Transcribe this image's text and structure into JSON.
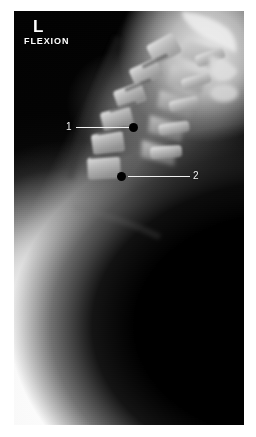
{
  "study": {
    "modality": "radiograph",
    "region": "cervical-spine",
    "projection_label": "FLEXION",
    "side_marker": "L",
    "view": "lateral"
  },
  "image": {
    "width": 256,
    "height": 437,
    "plate": {
      "left": 14,
      "top": 11,
      "width": 230,
      "height": 414
    },
    "background_color": "#ffffff",
    "film_dark_color": "#060606",
    "film_light_color": "#e4e4e4"
  },
  "annotations": {
    "marker_color": "#f2f2f2",
    "dot_color": "#000000",
    "items": [
      {
        "label": "1",
        "label_x": 66,
        "label_y": 122,
        "line_x": 76,
        "line_y": 127,
        "line_width": 54,
        "dot_x": 129,
        "dot_y": 123
      },
      {
        "label": "2",
        "label_x": 193,
        "label_y": 171,
        "line_x": 128,
        "line_y": 176,
        "line_width": 62,
        "dot_x": 117,
        "dot_y": 172
      }
    ]
  },
  "anatomy": {
    "vertebrae": [
      {
        "name": "C2-body",
        "x": 150,
        "y": 38,
        "w": 30,
        "h": 22,
        "rot": -28
      },
      {
        "name": "C3-body",
        "x": 132,
        "y": 62,
        "w": 30,
        "h": 20,
        "rot": -24
      },
      {
        "name": "C4-body",
        "x": 116,
        "y": 85,
        "w": 30,
        "h": 20,
        "rot": -20
      },
      {
        "name": "C5-body",
        "x": 103,
        "y": 108,
        "w": 31,
        "h": 20,
        "rot": -14
      },
      {
        "name": "C6-body",
        "x": 94,
        "y": 132,
        "w": 32,
        "h": 21,
        "rot": -8
      },
      {
        "name": "C7-body",
        "x": 90,
        "y": 157,
        "w": 33,
        "h": 22,
        "rot": -3
      }
    ],
    "spinous_processes": [
      {
        "name": "C2-spinous",
        "x": 196,
        "y": 46,
        "w": 30,
        "h": 12,
        "rot": -20
      },
      {
        "name": "C3-spinous",
        "x": 182,
        "y": 70,
        "w": 30,
        "h": 11,
        "rot": -16
      },
      {
        "name": "C4-spinous",
        "x": 170,
        "y": 93,
        "w": 30,
        "h": 11,
        "rot": -12
      },
      {
        "name": "C5-spinous",
        "x": 160,
        "y": 117,
        "w": 31,
        "h": 11,
        "rot": -8
      },
      {
        "name": "C6-spinous",
        "x": 152,
        "y": 141,
        "w": 32,
        "h": 12,
        "rot": -4
      }
    ]
  }
}
